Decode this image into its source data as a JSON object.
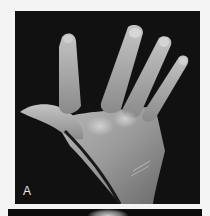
{
  "figure": {
    "panels": [
      {
        "label": "A",
        "subject": "dorsal view of left hand with fingers spread",
        "background_color": "#111111"
      },
      {
        "label": "",
        "subject": "partially visible second panel"
      }
    ]
  },
  "colors": {
    "page_background": "#f4f4f4",
    "panel_background": "#111111",
    "label_color": "#e8e8e8"
  }
}
